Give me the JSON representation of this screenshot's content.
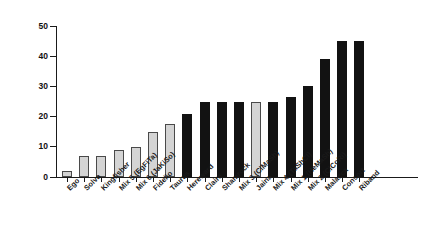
{
  "chart_data": {
    "type": "bar",
    "title": "",
    "xlabel": "",
    "ylabel": "Weed Cover (%)",
    "ylim": [
      0,
      50
    ],
    "yticks": [
      0,
      10,
      20,
      30,
      40,
      50
    ],
    "ytick_labels": [
      "0",
      "10",
      "20",
      "30",
      "40",
      "50"
    ],
    "grid": false,
    "legend": "none",
    "categories": [
      "Ego",
      "Solva",
      "Kingfisher",
      "Mix 5 (EgFiTa)",
      "Mix 6 (JaKiSo)",
      "Fidelio",
      "Taurus",
      "Hereward",
      "Claire",
      "Shamrock",
      "Mix 3 (ClMaSh)",
      "Jaina",
      "Mix 4 (TaShCl)",
      "Mix 1 (HeMaSh)",
      "Mix 2 (ClCoRi)",
      "Malacca",
      "Consort",
      "Riband"
    ],
    "values": [
      2,
      7,
      7,
      9,
      10,
      15,
      17.5,
      21,
      25,
      25,
      25,
      25,
      25,
      26.5,
      30,
      39,
      45,
      45
    ],
    "bar_styles": [
      "light",
      "light",
      "light",
      "light",
      "light",
      "light",
      "light",
      "dark",
      "dark",
      "dark",
      "dark",
      "light",
      "dark",
      "dark",
      "dark",
      "dark",
      "dark",
      "dark"
    ],
    "colors": {
      "light_fill": "#d4d4d4",
      "light_edge": "#4a4a4a",
      "dark_fill": "#121212",
      "axis": "#1a1a1a",
      "background": "#ffffff"
    }
  }
}
